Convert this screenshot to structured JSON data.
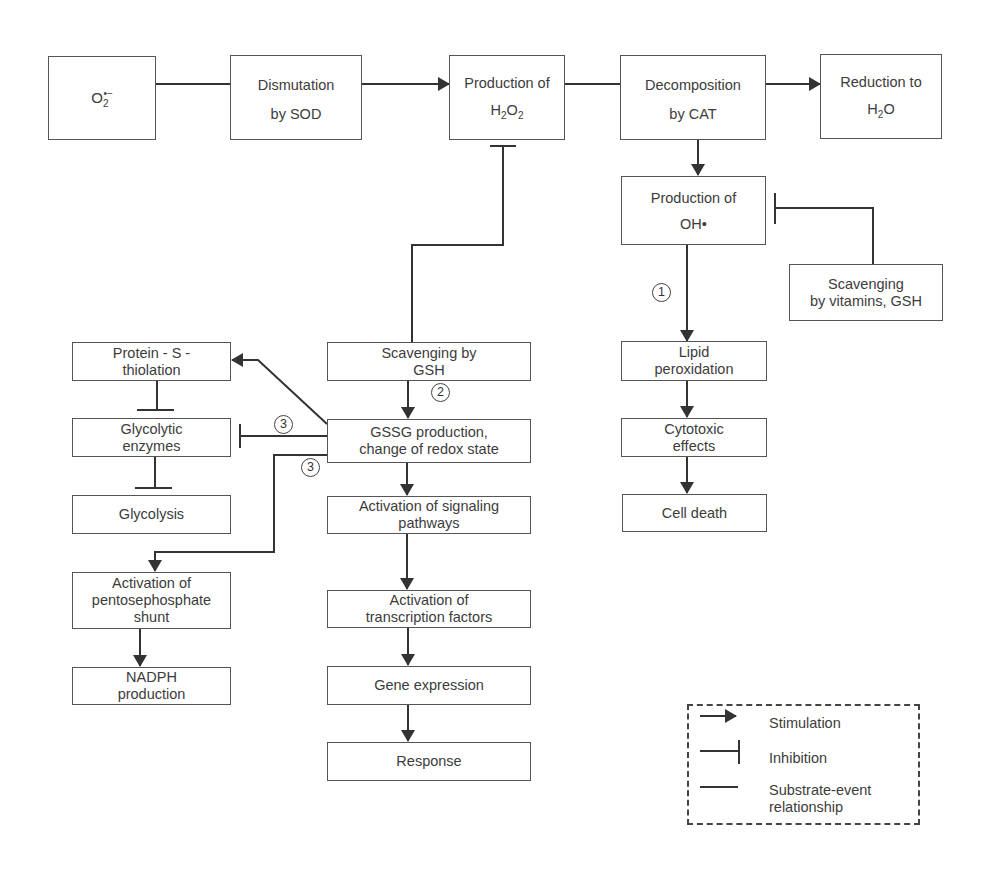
{
  "diagram": {
    "nodes": {
      "superoxide": {
        "line1": "O",
        "sub": "2",
        "sup": "•−"
      },
      "dismutation": {
        "line1": "Dismutation",
        "line2": "by SOD"
      },
      "h2o2": {
        "line1": "Production of",
        "line2_pre": "H",
        "line2_sub1": "2",
        "line2_mid": "O",
        "line2_sub2": "2"
      },
      "decomposition": {
        "line1": "Decomposition",
        "line2": "by CAT"
      },
      "reduction": {
        "line1": "Reduction to",
        "line2_pre": "H",
        "line2_sub": "2",
        "line2_post": "O"
      },
      "hydroxyl": {
        "line1": "Production of",
        "line2": "OH•"
      },
      "scavenging_vitamins": {
        "line1": "Scavenging",
        "line2": "by vitamins, GSH"
      },
      "lipid": {
        "line1": "Lipid",
        "line2": "peroxidation"
      },
      "cytotoxic": {
        "line1": "Cytotoxic",
        "line2": "effects"
      },
      "cell_death": {
        "line1": "Cell death"
      },
      "scavenging_gsh": {
        "line1": "Scavenging by",
        "line2": "GSH"
      },
      "gssg": {
        "line1": "GSSG production,",
        "line2": "change of redox state"
      },
      "signaling": {
        "line1": "Activation of signaling",
        "line2": "pathways"
      },
      "transcription": {
        "line1": "Activation of",
        "line2": "transcription factors"
      },
      "gene_expression": {
        "line1": "Gene expression"
      },
      "response": {
        "line1": "Response"
      },
      "protein_s": {
        "line1": "Protein - S -",
        "line2": "thiolation"
      },
      "glycolytic_enzymes": {
        "line1": "Glycolytic",
        "line2": "enzymes"
      },
      "glycolysis": {
        "line1": "Glycolysis"
      },
      "pentose": {
        "line1": "Activation of",
        "line2": "pentosephosphate",
        "line3": "shunt"
      },
      "nadph": {
        "line1": "NADPH",
        "line2": "production"
      }
    },
    "badges": {
      "one": "1",
      "two": "2",
      "three_a": "3",
      "three_b": "3"
    },
    "edges": [
      {
        "from": "superoxide",
        "to": "dismutation",
        "type": "substrate-event"
      },
      {
        "from": "dismutation",
        "to": "h2o2",
        "type": "stimulation"
      },
      {
        "from": "h2o2",
        "to": "decomposition",
        "type": "substrate-event"
      },
      {
        "from": "decomposition",
        "to": "reduction",
        "type": "stimulation"
      },
      {
        "from": "decomposition",
        "to": "hydroxyl",
        "type": "stimulation"
      },
      {
        "from": "scavenging_vitamins",
        "to": "hydroxyl",
        "type": "inhibition"
      },
      {
        "from": "hydroxyl",
        "to": "lipid",
        "type": "stimulation",
        "label": "1"
      },
      {
        "from": "lipid",
        "to": "cytotoxic",
        "type": "stimulation"
      },
      {
        "from": "cytotoxic",
        "to": "cell_death",
        "type": "stimulation"
      },
      {
        "from": "scavenging_gsh",
        "to": "h2o2",
        "type": "inhibition"
      },
      {
        "from": "scavenging_gsh",
        "to": "gssg",
        "type": "stimulation",
        "label": "2"
      },
      {
        "from": "gssg",
        "to": "protein_s",
        "type": "stimulation"
      },
      {
        "from": "gssg",
        "to": "glycolytic_enzymes",
        "type": "inhibition",
        "label": "3"
      },
      {
        "from": "gssg",
        "to": "pentose",
        "type": "stimulation",
        "label": "3"
      },
      {
        "from": "gssg",
        "to": "signaling",
        "type": "stimulation"
      },
      {
        "from": "signaling",
        "to": "transcription",
        "type": "stimulation"
      },
      {
        "from": "transcription",
        "to": "gene_expression",
        "type": "stimulation"
      },
      {
        "from": "gene_expression",
        "to": "response",
        "type": "stimulation"
      },
      {
        "from": "protein_s",
        "to": "glycolytic_enzymes",
        "type": "inhibition"
      },
      {
        "from": "glycolytic_enzymes",
        "to": "glycolysis",
        "type": "inhibition"
      },
      {
        "from": "pentose",
        "to": "nadph",
        "type": "stimulation"
      }
    ]
  },
  "legend": {
    "stimulation": "Stimulation",
    "inhibition": "Inhibition",
    "substrate_line1": "Substrate-event",
    "substrate_line2": "relationship"
  },
  "colors": {
    "line": "#333333",
    "box_border": "#555555",
    "text": "#3c3c3c"
  }
}
